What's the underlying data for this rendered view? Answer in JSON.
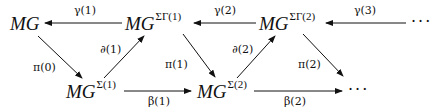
{
  "diagram": {
    "nodes": {
      "mg": {
        "base": "MG",
        "sup": ""
      },
      "mg_sg1": {
        "base": "MG",
        "sup": "ΣΓ(1)"
      },
      "mg_sg2": {
        "base": "MG",
        "sup": "ΣΓ(2)"
      },
      "mg_s1": {
        "base": "MG",
        "sup": "Σ(1)"
      },
      "mg_s2": {
        "base": "MG",
        "sup": "Σ(2)"
      },
      "top_ellipsis": "···",
      "bottom_ellipsis": "···"
    },
    "edges": {
      "gamma1": "γ(1)",
      "gamma2": "γ(2)",
      "gamma3": "γ(3)",
      "pi0": "π(0)",
      "pi1": "π(1)",
      "pi2": "π(2)",
      "partial1": "∂(1)",
      "partial2": "∂(2)",
      "beta1": "β(1)",
      "beta2": "β(2)"
    }
  }
}
